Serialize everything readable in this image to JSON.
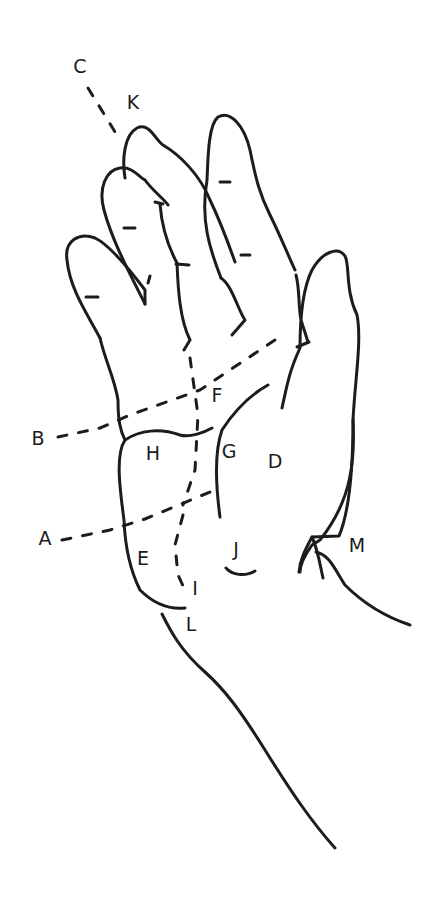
{
  "diagram": {
    "type": "hand-anatomy-sketch",
    "stroke_color": "#1c1c1c",
    "background": "#ffffff",
    "labels": {
      "C": "C",
      "K": "K",
      "B": "B",
      "A": "A",
      "F": "F",
      "H": "H",
      "G": "G",
      "D": "D",
      "E": "E",
      "I": "I",
      "J": "J",
      "L": "L",
      "M": "M"
    }
  }
}
